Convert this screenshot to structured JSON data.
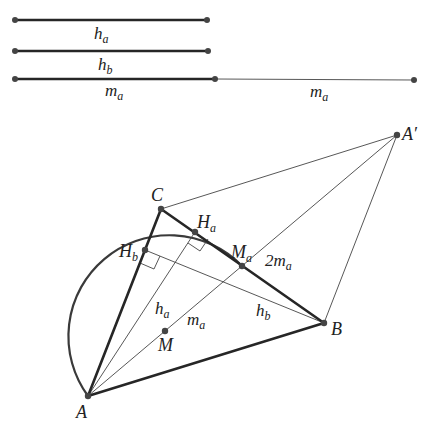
{
  "diagram": {
    "title": "",
    "segments_legend": [
      {
        "label": "h",
        "sub": "a",
        "y": 20,
        "x1": 15,
        "x2": 207
      },
      {
        "label": "h",
        "sub": "b",
        "y": 51,
        "x1": 15,
        "x2": 208
      },
      {
        "label": "m",
        "sub": "a",
        "y": 79,
        "x1": 15,
        "x2": 215
      },
      {
        "label": "m",
        "sub": "a",
        "y": 79,
        "x1": 215,
        "x2": 414
      }
    ],
    "points": {
      "A": {
        "label": "A",
        "x": 88,
        "y": 396
      },
      "B": {
        "label": "B",
        "x": 324,
        "y": 323
      },
      "C": {
        "label": "C",
        "x": 161,
        "y": 209
      },
      "A_prime": {
        "label": "A′",
        "x": 397,
        "y": 135
      },
      "Ma": {
        "label": "M",
        "sub": "a",
        "x": 242,
        "y": 266
      },
      "M": {
        "label": "M",
        "x": 165,
        "y": 331
      },
      "Ha": {
        "label": "H",
        "sub": "a",
        "x": 195,
        "y": 232
      },
      "Hb": {
        "label": "H",
        "sub": "b",
        "x": 145,
        "y": 250
      }
    },
    "segment_labels": {
      "ha": {
        "main": "h",
        "sub": "a"
      },
      "ma": {
        "main": "m",
        "sub": "a"
      },
      "hb": {
        "main": "h",
        "sub": "b"
      },
      "two_ma": {
        "main": "2m",
        "sub": "a"
      }
    },
    "arc": {
      "center": "M",
      "radius": 101,
      "from": "A",
      "to": "Ma"
    },
    "colors": {
      "stroke": "#262626",
      "thin": "#444444",
      "background": "#ffffff"
    }
  }
}
